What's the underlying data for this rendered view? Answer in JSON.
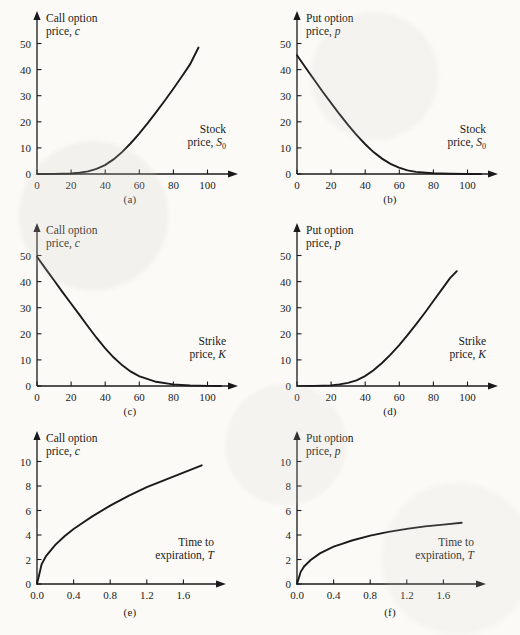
{
  "figure": {
    "background": "#fbfaf7",
    "ink": "#1a1a1a",
    "panel_count": 6
  },
  "panels": [
    {
      "id": "a",
      "caption": "(a)",
      "ylabel_line1": "Call option",
      "ylabel_line2": "price,",
      "ylabel_var": "c",
      "xlabel_line1": "Stock",
      "xlabel_line2": "price,",
      "xlabel_var": "S",
      "xlabel_sub": "0"
    },
    {
      "id": "b",
      "caption": "(b)",
      "ylabel_line1": "Put option",
      "ylabel_line2": "price,",
      "ylabel_var": "p",
      "xlabel_line1": "Stock",
      "xlabel_line2": "price,",
      "xlabel_var": "S",
      "xlabel_sub": "0"
    },
    {
      "id": "c",
      "caption": "(c)",
      "ylabel_line1": "Call option",
      "ylabel_line2": "price,",
      "ylabel_var": "c",
      "xlabel_line1": "Strike",
      "xlabel_line2": "price,",
      "xlabel_var": "K",
      "xlabel_sub": ""
    },
    {
      "id": "d",
      "caption": "(d)",
      "ylabel_line1": "Put option",
      "ylabel_line2": "price,",
      "ylabel_var": "p",
      "xlabel_line1": "Strike",
      "xlabel_line2": "price,",
      "xlabel_var": "K",
      "xlabel_sub": ""
    },
    {
      "id": "e",
      "caption": "(e)",
      "ylabel_line1": "Call option",
      "ylabel_line2": "price,",
      "ylabel_var": "c",
      "xlabel_line1": "Time to",
      "xlabel_line2": "expiration,",
      "xlabel_var": "T",
      "xlabel_sub": ""
    },
    {
      "id": "f",
      "caption": "(f)",
      "ylabel_line1": "Put option",
      "ylabel_line2": "price,",
      "ylabel_var": "p",
      "xlabel_line1": "Time to",
      "xlabel_line2": "expiration,",
      "xlabel_var": "T",
      "xlabel_sub": ""
    }
  ],
  "chart_data": [
    {
      "type": "line",
      "panel": "a",
      "title": "Call option price vs stock price",
      "xlabel": "Stock price, S0",
      "ylabel": "Call option price, c",
      "xlim": [
        0,
        112
      ],
      "ylim": [
        0,
        57
      ],
      "xticks": [
        0,
        20,
        40,
        60,
        80,
        100
      ],
      "yticks": [
        0,
        10,
        20,
        30,
        40,
        50
      ],
      "grid": false,
      "legend": "none",
      "x": [
        0,
        10,
        20,
        25,
        30,
        35,
        40,
        45,
        50,
        55,
        60,
        65,
        70,
        75,
        80,
        85,
        90,
        95
      ],
      "y": [
        0.0,
        0.05,
        0.2,
        0.5,
        1.0,
        2.0,
        3.4,
        5.6,
        8.4,
        11.7,
        15.4,
        19.4,
        23.6,
        28.0,
        32.5,
        37.2,
        42.0,
        48.5
      ]
    },
    {
      "type": "line",
      "panel": "b",
      "title": "Put option price vs stock price",
      "xlabel": "Stock price, S0",
      "ylabel": "Put option price, p",
      "xlim": [
        0,
        112
      ],
      "ylim": [
        0,
        57
      ],
      "xticks": [
        0,
        20,
        40,
        60,
        80,
        100
      ],
      "yticks": [
        0,
        10,
        20,
        30,
        40,
        50
      ],
      "grid": false,
      "legend": "none",
      "x": [
        0,
        5,
        10,
        15,
        20,
        25,
        30,
        35,
        40,
        45,
        50,
        55,
        60,
        65,
        70,
        80,
        90,
        100,
        108
      ],
      "y": [
        45.5,
        40.8,
        36.2,
        31.6,
        27.2,
        22.9,
        18.8,
        15.0,
        11.5,
        8.4,
        5.9,
        3.9,
        2.4,
        1.4,
        0.8,
        0.25,
        0.08,
        0.02,
        0.0
      ]
    },
    {
      "type": "line",
      "panel": "c",
      "title": "Call option price vs strike price",
      "xlabel": "Strike price, K",
      "ylabel": "Call option price, c",
      "xlim": [
        0,
        112
      ],
      "ylim": [
        0,
        57
      ],
      "xticks": [
        0,
        20,
        40,
        60,
        80,
        100
      ],
      "yticks": [
        0,
        10,
        20,
        30,
        40,
        50
      ],
      "grid": false,
      "legend": "none",
      "x": [
        0,
        5,
        10,
        15,
        20,
        25,
        30,
        35,
        40,
        45,
        50,
        55,
        60,
        70,
        80,
        90,
        100,
        108
      ],
      "y": [
        49.5,
        45.0,
        40.5,
        36.0,
        31.6,
        27.2,
        22.8,
        18.5,
        14.5,
        11.0,
        8.0,
        5.6,
        3.8,
        1.6,
        0.6,
        0.18,
        0.05,
        0.0
      ]
    },
    {
      "type": "line",
      "panel": "d",
      "title": "Put option price vs strike price",
      "xlabel": "Strike price, K",
      "ylabel": "Put option price, p",
      "xlim": [
        0,
        112
      ],
      "ylim": [
        0,
        57
      ],
      "xticks": [
        0,
        20,
        40,
        60,
        80,
        100
      ],
      "yticks": [
        0,
        10,
        20,
        30,
        40,
        50
      ],
      "grid": false,
      "legend": "none",
      "x": [
        0,
        10,
        20,
        25,
        30,
        35,
        40,
        45,
        50,
        55,
        60,
        65,
        70,
        75,
        80,
        85,
        90,
        94
      ],
      "y": [
        0.0,
        0.05,
        0.25,
        0.6,
        1.2,
        2.2,
        3.8,
        6.0,
        8.8,
        12.0,
        15.6,
        19.5,
        23.6,
        27.9,
        32.4,
        36.8,
        41.3,
        44.0
      ]
    },
    {
      "type": "line",
      "panel": "e",
      "title": "Call option price vs time to expiration",
      "xlabel": "Time to expiration, T",
      "ylabel": "Call option price, c",
      "xlim": [
        0,
        2.05
      ],
      "ylim": [
        0,
        11.4
      ],
      "xticks": [
        0.0,
        0.4,
        0.8,
        1.2,
        1.6
      ],
      "yticks": [
        0,
        2,
        4,
        6,
        8,
        10
      ],
      "grid": false,
      "legend": "none",
      "x": [
        0.0,
        0.05,
        0.1,
        0.2,
        0.3,
        0.4,
        0.5,
        0.6,
        0.8,
        1.0,
        1.2,
        1.4,
        1.6,
        1.8
      ],
      "y": [
        0.0,
        1.6,
        2.3,
        3.2,
        3.9,
        4.5,
        5.0,
        5.5,
        6.4,
        7.2,
        7.9,
        8.5,
        9.1,
        9.7
      ]
    },
    {
      "type": "line",
      "panel": "f",
      "title": "Put option price vs time to expiration",
      "xlabel": "Time to expiration, T",
      "ylabel": "Put option price, p",
      "xlim": [
        0,
        2.05
      ],
      "ylim": [
        0,
        11.4
      ],
      "xticks": [
        0.0,
        0.4,
        0.8,
        1.2,
        1.6
      ],
      "yticks": [
        0,
        2,
        4,
        6,
        8,
        10
      ],
      "grid": false,
      "legend": "none",
      "x": [
        0.0,
        0.04,
        0.08,
        0.15,
        0.25,
        0.4,
        0.5,
        0.6,
        0.8,
        1.0,
        1.2,
        1.4,
        1.6,
        1.8
      ],
      "y": [
        0.0,
        1.0,
        1.45,
        1.95,
        2.5,
        3.05,
        3.3,
        3.55,
        3.95,
        4.25,
        4.5,
        4.7,
        4.85,
        5.0
      ]
    }
  ]
}
